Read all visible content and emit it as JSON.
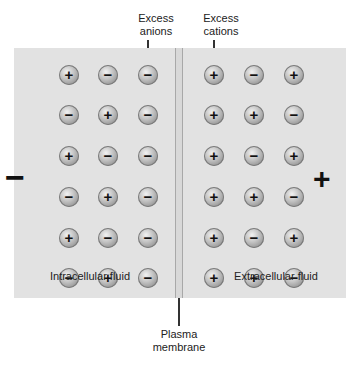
{
  "labels": {
    "excess_anions": [
      "Excess",
      "anions"
    ],
    "excess_cations": [
      "Excess",
      "cations"
    ],
    "intracellular": "Intracellular fluid",
    "extracellular": "Extracellular fluid",
    "membrane": [
      "Plasma",
      "membrane"
    ]
  },
  "side_charges": {
    "left": "−",
    "right": "+"
  },
  "glyphs": {
    "+": "+",
    "-": "−"
  },
  "colors": {
    "fluid_bg": "#e2e2e2",
    "ion_fill": "#bdbdbd",
    "ink": "#111111"
  },
  "intracellular_ions": [
    [
      "+",
      "-",
      "-"
    ],
    [
      "-",
      "+",
      "-"
    ],
    [
      "+",
      "-",
      "-"
    ],
    [
      "-",
      "+",
      "-"
    ],
    [
      "+",
      "-",
      "-"
    ],
    [
      "-",
      "+",
      "-"
    ]
  ],
  "extracellular_ions": [
    [
      "+",
      "-",
      "+"
    ],
    [
      "+",
      "+",
      "-"
    ],
    [
      "+",
      "-",
      "+"
    ],
    [
      "+",
      "+",
      "-"
    ],
    [
      "+",
      "-",
      "+"
    ],
    [
      "+",
      "+",
      "-"
    ]
  ]
}
